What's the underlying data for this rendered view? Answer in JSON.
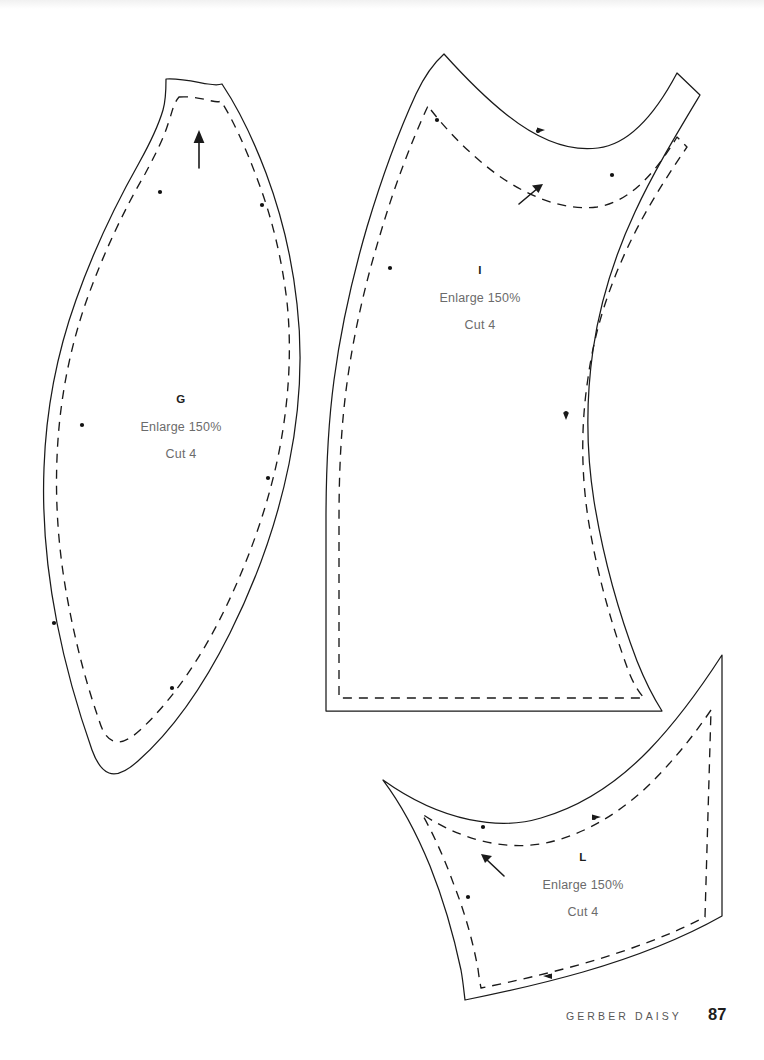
{
  "page": {
    "background_color": "#ffffff",
    "ink_color": "#1a1a1a",
    "text_color": "#6b6b6b",
    "width": 764,
    "height": 1060
  },
  "footer": {
    "title": "GERBER DAISY",
    "page_number": "87"
  },
  "pieces": [
    {
      "id": "G",
      "letter": "G",
      "enlarge": "Enlarge 150%",
      "cut": "Cut 4",
      "grainline_direction": "up",
      "label_x": 181,
      "label_y": 401
    },
    {
      "id": "I",
      "letter": "I",
      "enlarge": "Enlarge 150%",
      "cut": "Cut 4",
      "grainline_direction": "up-right",
      "label_x": 480,
      "label_y": 272
    },
    {
      "id": "L",
      "letter": "L",
      "enlarge": "Enlarge 150%",
      "cut": "Cut 4",
      "grainline_direction": "up-left",
      "label_x": 583,
      "label_y": 859
    }
  ]
}
